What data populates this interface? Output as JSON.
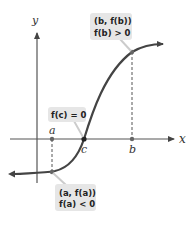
{
  "diagram": {
    "axes": {
      "x_label": "x",
      "y_label": "y"
    },
    "points": {
      "a": {
        "label": "a"
      },
      "b": {
        "label": "b"
      },
      "c": {
        "label": "c"
      }
    },
    "callouts": {
      "b_point": {
        "line1": "(b, f(b))",
        "line2": "f(b) > 0"
      },
      "c_point": {
        "line1": "f(c) = 0"
      },
      "a_point": {
        "line1": "(a, f(a))",
        "line2": "f(a) < 0"
      }
    },
    "colors": {
      "curve": "#444444",
      "axis": "#555555",
      "callout_bg": "#e6e6e6",
      "callout_text": "#222222",
      "dashed": "#555555"
    }
  }
}
